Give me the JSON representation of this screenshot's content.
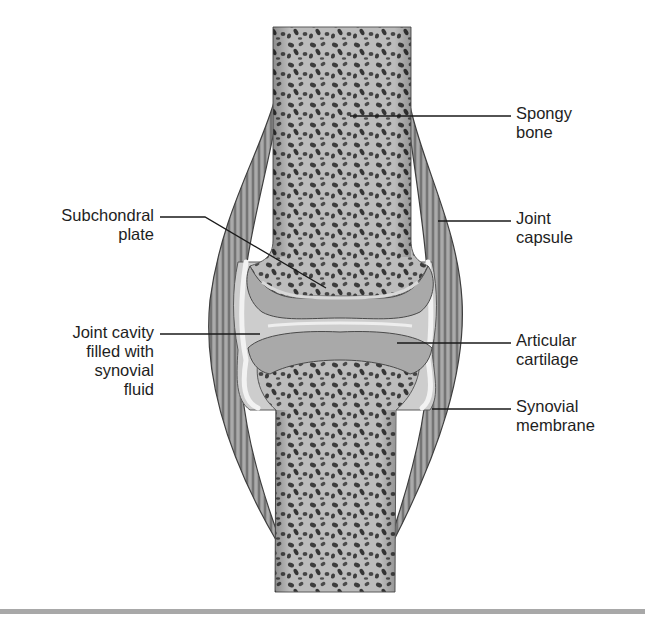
{
  "figure": {
    "labels": [
      {
        "id": "spongy-bone",
        "text": "Spongy\nbone",
        "side": "right"
      },
      {
        "id": "subchondral-plate",
        "text": "Subchondral\nplate",
        "side": "left"
      },
      {
        "id": "joint-capsule",
        "text": "Joint\ncapsule",
        "side": "right"
      },
      {
        "id": "joint-cavity",
        "text": "Joint cavity\nfilled with\nsynovial\nfluid",
        "side": "left"
      },
      {
        "id": "articular-cartilage",
        "text": "Articular\ncartilage",
        "side": "right"
      },
      {
        "id": "synovial-membrane",
        "text": "Synovial\nmembrane",
        "side": "right"
      }
    ],
    "colors": {
      "bone": "#b9b9b9",
      "bone_pores": "#3a3a3a",
      "cartilage": "#a6a6a6",
      "cavity": "#cfcfcf",
      "capsule": "#8d8d8d",
      "leader": "#1a1a1a",
      "rule": "#a8a8a8"
    }
  }
}
